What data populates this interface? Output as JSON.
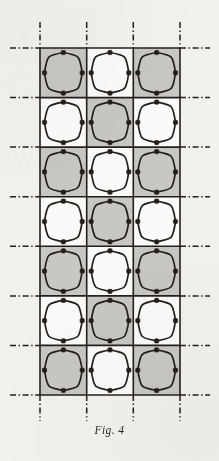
{
  "figure": {
    "caption": "Fig. 4",
    "caption_y": 424,
    "background_color": "#f3f1ed",
    "ink_color": "#231f1c",
    "shaded_cell_color": "#c9c7c4",
    "unshaded_cell_color": "#fbfaf8",
    "grid": {
      "columns": 3,
      "rows": 7,
      "left": 40,
      "top": 48,
      "right": 180,
      "bottom": 395,
      "cell_width": 46.7,
      "cell_height": 49.6,
      "column_boundaries": [
        40,
        86.7,
        133.3,
        180
      ],
      "row_boundaries": [
        48,
        97.6,
        147.1,
        196.7,
        246.3,
        295.9,
        345.4,
        395
      ],
      "border_width": 1.6
    },
    "centerlines": {
      "style": "dash-dot",
      "color": "#231f1c",
      "width": 1.5,
      "overhang": 18,
      "vertical_x": [
        40,
        86.7,
        133.3,
        180
      ],
      "horizontal_y": [
        48,
        97.6,
        147.1,
        196.7,
        246.3,
        295.9,
        345.4,
        395
      ]
    },
    "motif": {
      "name": "rounded-diamond-squircle",
      "outline_width": 1.7,
      "inset": 4.5,
      "connector_tabs": 4,
      "connector_size": 4.2
    },
    "shading_pattern": "checkerboard",
    "cells": [
      [
        {
          "shaded": true
        },
        {
          "shaded": false
        },
        {
          "shaded": true
        }
      ],
      [
        {
          "shaded": false
        },
        {
          "shaded": true
        },
        {
          "shaded": false
        }
      ],
      [
        {
          "shaded": true
        },
        {
          "shaded": false
        },
        {
          "shaded": true
        }
      ],
      [
        {
          "shaded": false
        },
        {
          "shaded": true
        },
        {
          "shaded": false
        }
      ],
      [
        {
          "shaded": true
        },
        {
          "shaded": false
        },
        {
          "shaded": true
        }
      ],
      [
        {
          "shaded": false
        },
        {
          "shaded": true
        },
        {
          "shaded": false
        }
      ],
      [
        {
          "shaded": true
        },
        {
          "shaded": false
        },
        {
          "shaded": true
        }
      ]
    ]
  }
}
